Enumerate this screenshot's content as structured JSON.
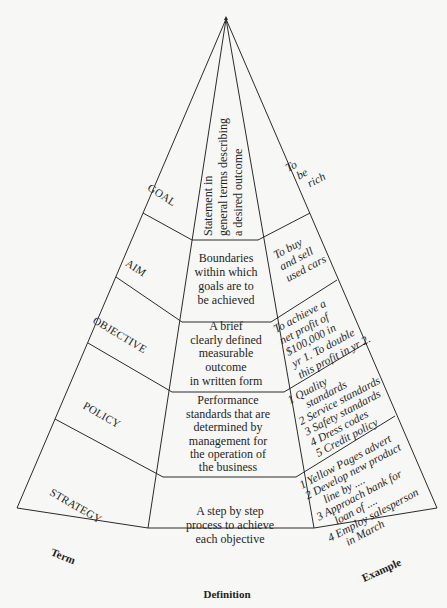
{
  "diagram": {
    "type": "pyramid",
    "column_labels": {
      "term": "Term",
      "definition": "Definition",
      "example": "Example"
    },
    "levels": [
      {
        "term": "GOAL",
        "definition": [
          "Statement in",
          "general terms describing",
          "a desired outcome"
        ],
        "example": [
          "To",
          "be",
          "rich"
        ]
      },
      {
        "term": "AIM",
        "definition": [
          "Boundaries",
          "within which",
          "goals are to",
          "be achieved"
        ],
        "example": [
          "To buy",
          "and sell",
          "used cars"
        ]
      },
      {
        "term": "OBJECTIVE",
        "definition": [
          "A brief",
          "clearly defined",
          "measurable",
          "outcome",
          "in written form"
        ],
        "example": [
          "To achieve a",
          "net profit of",
          "$100,000 in",
          "yr 1. To double",
          "this profit in yr 2."
        ]
      },
      {
        "term": "POLICY",
        "definition": [
          "Performance",
          "standards that are",
          "determined by",
          "management for",
          "the operation of",
          "the business"
        ],
        "example": [
          "1 Quality",
          "standards",
          "2 Service standards",
          "3 Safety standards",
          "4 Dress codes",
          "5 Credit policy"
        ]
      },
      {
        "term": "STRATEGY",
        "definition": [
          "A step by step",
          "process to achieve",
          "each objective"
        ],
        "example": [
          "1 Yellow Pages advert",
          "2 Develop new product",
          "line by ....",
          "3 Approach bank for",
          "loan of ....",
          "4 Employ salesperson",
          "in March"
        ]
      }
    ]
  }
}
